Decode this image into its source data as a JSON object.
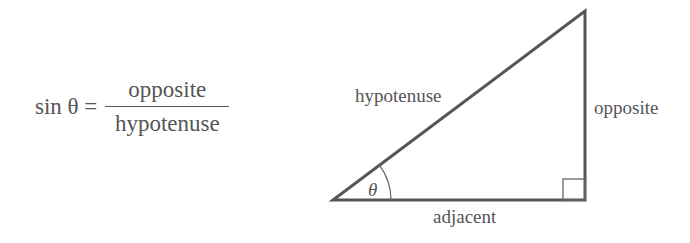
{
  "formula": {
    "lhs": "sin θ =",
    "numerator": "opposite",
    "denominator": "hypotenuse"
  },
  "triangle": {
    "labels": {
      "hypotenuse": "hypotenuse",
      "opposite": "opposite",
      "adjacent": "adjacent",
      "angle": "θ"
    },
    "vertices": {
      "angle_vertex": [
        333,
        200
      ],
      "right_angle_vertex": [
        585,
        200
      ],
      "top_vertex": [
        585,
        11
      ]
    },
    "stroke_color": "#555555"
  }
}
